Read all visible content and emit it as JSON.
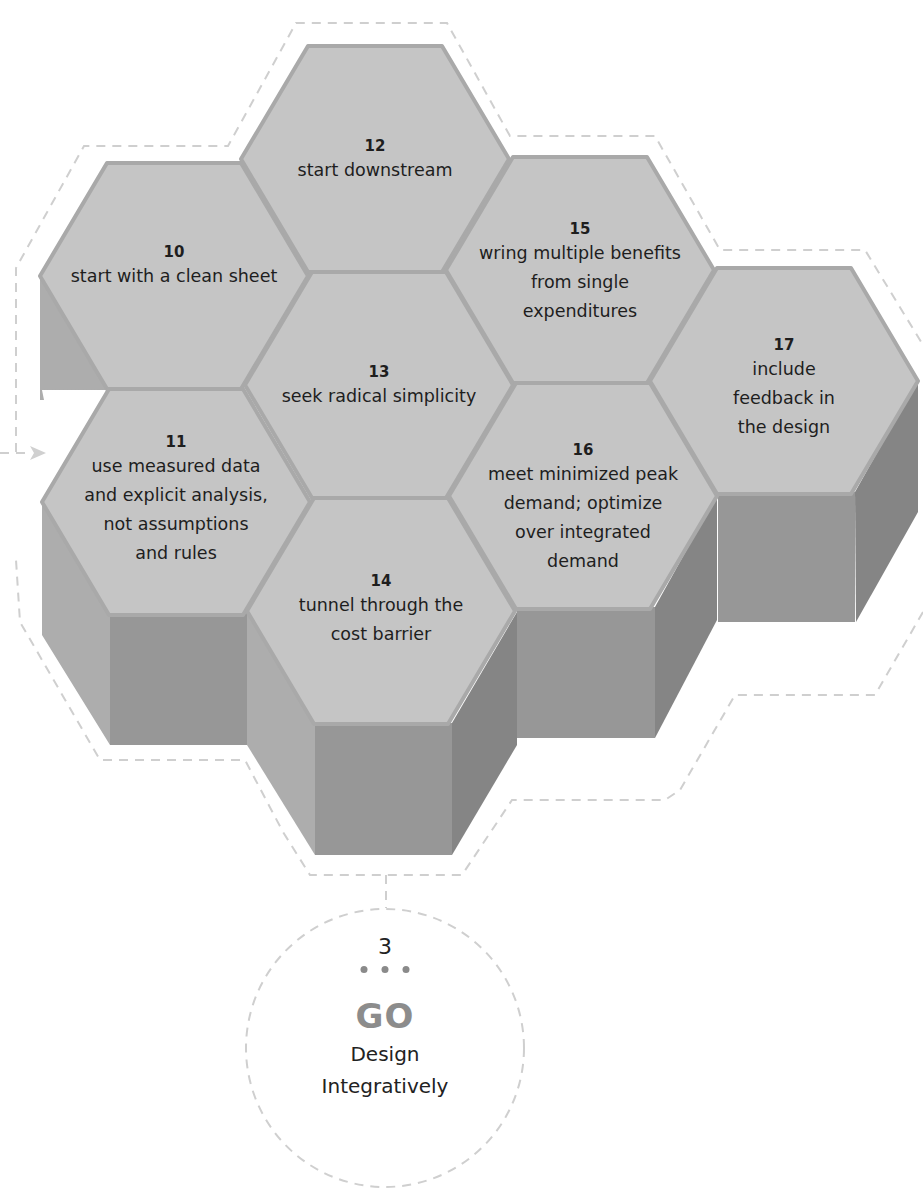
{
  "hexagons": [
    {
      "id": "10",
      "number": "10",
      "text": "start with a clean sheet",
      "cx": 174,
      "cy": 276
    },
    {
      "id": "11",
      "number": "11",
      "text": "use measured data\nand explicit analysis,\nnot assumptions\nand rules",
      "cx": 176,
      "cy": 502
    },
    {
      "id": "12",
      "number": "12",
      "text": "start downstream",
      "cx": 375,
      "cy": 159
    },
    {
      "id": "13",
      "number": "13",
      "text": "seek radical simplicity",
      "cx": 379,
      "cy": 385
    },
    {
      "id": "14",
      "number": "14",
      "text": "tunnel through the\ncost barrier",
      "cx": 381,
      "cy": 611
    },
    {
      "id": "15",
      "number": "15",
      "text": "wring multiple benefits\nfrom single\nexpenditures",
      "cx": 580,
      "cy": 270
    },
    {
      "id": "16",
      "number": "16",
      "text": "meet minimized peak\ndemand; optimize\nover integrated\ndemand",
      "cx": 583,
      "cy": 496
    },
    {
      "id": "17",
      "number": "17",
      "text": "include feedback in\nthe design",
      "cx": 784,
      "cy": 381
    }
  ],
  "step": {
    "number": "3",
    "dots": "• • •",
    "keyword": "GO",
    "title": "Design\nIntegratively"
  },
  "colors": {
    "hex_top": "#c5c5c5",
    "hex_edge": "#a9a9a9",
    "face_left": "#adadad",
    "face_front": "#979797",
    "face_right": "#858585",
    "dashed_outline": "#cfcfcf",
    "go_text": "#8c8c8c"
  }
}
